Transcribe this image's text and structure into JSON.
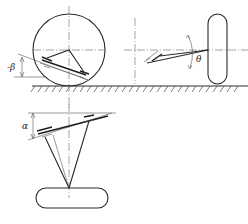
{
  "diagram": {
    "labels": {
      "beta": "-β",
      "theta": "θ",
      "alpha": "α"
    },
    "views": [
      {
        "name": "side-view",
        "feature": "circular wheel with inclined arm angle β"
      },
      {
        "name": "front-view",
        "feature": "wheel section with arm angle θ"
      },
      {
        "name": "top-view",
        "feature": "wheel with arms converging, angle α"
      }
    ],
    "colors": {
      "line": "#2a2a2a",
      "background": "#ffffff"
    }
  }
}
